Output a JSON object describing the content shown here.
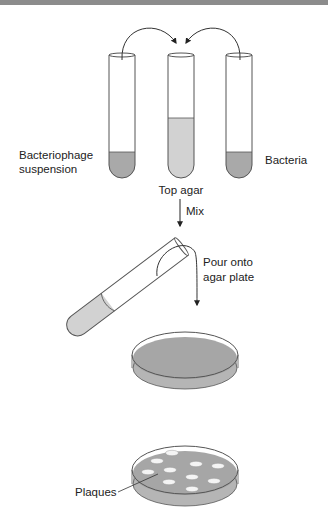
{
  "colors": {
    "top_bar": "#8c8c8c",
    "outline": "#555555",
    "liquid_dark": "#a9a9a9",
    "liquid_light": "#d2d2d2",
    "agar": "#a6a6a6",
    "plate_side": "#b5b5b5",
    "plaque": "#f4f4f4",
    "text": "#222222"
  },
  "labels": {
    "bacteriophage_line1": "Bacteriophage",
    "bacteriophage_line2": "suspension",
    "bacteria": "Bacteria",
    "top_agar": "Top agar",
    "mix": "Mix",
    "pour_line1": "Pour onto",
    "pour_line2": "agar plate",
    "plaques": "Plaques"
  },
  "steps": [
    {
      "name": "combine",
      "description": "Bacteriophage suspension and Bacteria added to Top agar"
    },
    {
      "name": "mix",
      "description": "Mix"
    },
    {
      "name": "pour",
      "description": "Pour onto agar plate"
    },
    {
      "name": "result",
      "description": "Plaques"
    }
  ],
  "plaque_count": 10
}
